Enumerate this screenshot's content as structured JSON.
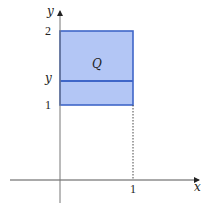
{
  "diagram": {
    "type": "region-plot",
    "axes": {
      "x_label": "x",
      "y_label": "y",
      "x_ticks": [
        {
          "value": 1,
          "label": "1"
        }
      ],
      "y_ticks": [
        {
          "value": 1,
          "label": "1"
        },
        {
          "value": 2,
          "label": "2"
        }
      ]
    },
    "region": {
      "label": "Q",
      "x_range": [
        0,
        1
      ],
      "y_range": [
        1,
        2
      ],
      "fill_color": "#b3c6f5",
      "stroke_color": "#3f66c8"
    },
    "cross_section": {
      "label": "y",
      "orientation": "horizontal",
      "color": "#3f66c8"
    },
    "guide_line": {
      "style": "dotted",
      "from": "(1,1)",
      "to": "(1,0)"
    },
    "axis_color": "#555555"
  }
}
